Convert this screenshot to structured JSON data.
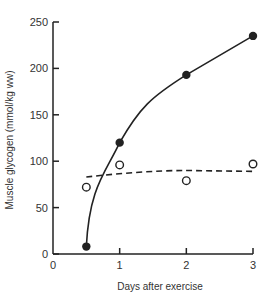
{
  "chart_data": {
    "type": "line",
    "title": "",
    "xlabel": "Days after exercise",
    "ylabel": "Muscle glycogen (mmol/kg ww)",
    "xlim": [
      0,
      3
    ],
    "ylim": [
      0,
      250
    ],
    "x_ticks": [
      "0",
      "1",
      "2",
      "3"
    ],
    "y_ticks": [
      "0",
      "50",
      "100",
      "150",
      "200",
      "250"
    ],
    "grid": false,
    "legend": null,
    "series": [
      {
        "name": "filled circles (solid curve)",
        "marker": "filled-circle",
        "line": "solid",
        "x": [
          0.5,
          1,
          2,
          3
        ],
        "values": [
          8,
          120,
          193,
          235
        ]
      },
      {
        "name": "open circles (dashed line)",
        "marker": "open-circle",
        "line": "dashed",
        "x": [
          0.5,
          1,
          2,
          3
        ],
        "values": [
          72,
          96,
          79,
          97
        ],
        "fit_line": {
          "x": [
            0.5,
            1,
            2,
            3
          ],
          "values": [
            83,
            87,
            90,
            89
          ]
        }
      }
    ]
  },
  "colors": {
    "ink": "#222222",
    "background": "#ffffff"
  }
}
